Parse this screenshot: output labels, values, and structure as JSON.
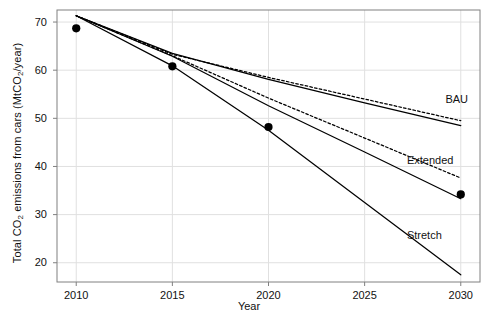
{
  "chart_data": {
    "type": "line",
    "title": "",
    "xlabel": "Year",
    "ylabel": "Total CO2 emissions from cars (MtCO2/year)",
    "ylabel_parts": {
      "pre": "Total CO",
      "sub1": "2",
      "mid": " emissions from cars (MtCO",
      "sub2": "2",
      "post": "/year)"
    },
    "xlim": [
      2009.0,
      2031.0
    ],
    "ylim": [
      16.0,
      72.5
    ],
    "grid": true,
    "legend_position": "inline-right",
    "xticks": [
      2010,
      2015,
      2020,
      2025,
      2030
    ],
    "xtick_labels": [
      "2010",
      "2015",
      "2020",
      "2025",
      "2030"
    ],
    "yticks": [
      20,
      30,
      40,
      50,
      60,
      70
    ],
    "ytick_labels": [
      "20",
      "30",
      "40",
      "50",
      "60",
      "70"
    ],
    "points": {
      "name": "Observed",
      "marker": "filled-circle",
      "x": [
        2010,
        2015,
        2020,
        2030
      ],
      "y": [
        68.7,
        60.8,
        48.2,
        34.2
      ]
    },
    "series": [
      {
        "name": "BAU",
        "style": "solid",
        "x": [
          2010,
          2015,
          2020,
          2025,
          2030
        ],
        "y": [
          71.3,
          63.5,
          58.1,
          53.2,
          48.5
        ]
      },
      {
        "name": "BAU-dashed",
        "style": "dashed",
        "x": [
          2010,
          2015,
          2020,
          2025,
          2030
        ],
        "y": [
          71.3,
          63.3,
          58.5,
          54.0,
          49.5
        ]
      },
      {
        "name": "Extended",
        "style": "solid",
        "x": [
          2010,
          2015,
          2020,
          2025,
          2030
        ],
        "y": [
          71.3,
          62.9,
          52.6,
          43.0,
          33.3
        ]
      },
      {
        "name": "Extended-dashed",
        "style": "dashed",
        "x": [
          2010,
          2015,
          2020,
          2025,
          2030
        ],
        "y": [
          71.3,
          63.0,
          54.2,
          45.9,
          37.6
        ]
      },
      {
        "name": "Stretch",
        "style": "solid",
        "x": [
          2010,
          2015,
          2020,
          2025,
          2030
        ],
        "y": [
          71.3,
          60.9,
          47.5,
          32.5,
          17.5
        ]
      }
    ],
    "annotations": [
      {
        "text": "BAU",
        "x": 2029.2,
        "y": 53.8
      },
      {
        "text": "Extended",
        "x": 2027.2,
        "y": 41.2
      },
      {
        "text": "Stretch",
        "x": 2027.2,
        "y": 25.6
      }
    ],
    "colors": {
      "line": "#000000",
      "grid": "#e0e0e0",
      "frame": "#808080",
      "text": "#111111",
      "marker": "#000000",
      "background": "#ffffff"
    }
  }
}
